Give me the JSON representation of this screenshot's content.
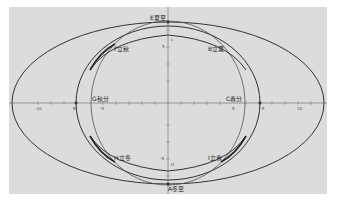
{
  "diagram": {
    "background": "#dcdcdc",
    "curve_color": "#333333",
    "axis_color": "#555555",
    "points": [
      {
        "id": "E",
        "label": "E夏至"
      },
      {
        "id": "F",
        "label": "F立秋"
      },
      {
        "id": "B",
        "label": "B立夏"
      },
      {
        "id": "G",
        "label": "G秋分"
      },
      {
        "id": "C",
        "label": "C春分"
      },
      {
        "id": "H",
        "label": "H立冬"
      },
      {
        "id": "I",
        "label": "I立春"
      },
      {
        "id": "A",
        "label": "A冬至"
      }
    ],
    "x_ticks": [
      "-10",
      "-5",
      "5",
      "10"
    ],
    "y_ticks": [
      "5",
      "-5"
    ],
    "axis_markers": {
      "left_on_x": "B",
      "right_on_x": "E",
      "top_y": "L",
      "bottom_y": "H"
    }
  }
}
